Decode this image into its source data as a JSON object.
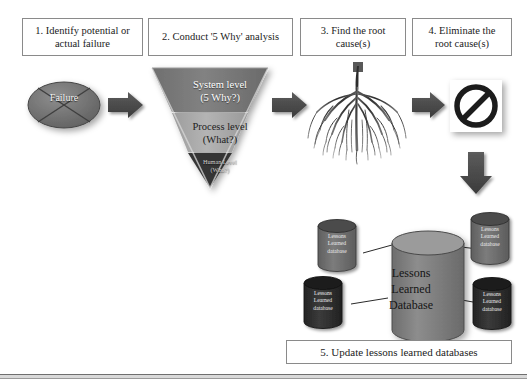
{
  "diagram": {
    "steps": [
      {
        "id": "step-1",
        "line1": "1. Identify potential or",
        "line2": "actual failure"
      },
      {
        "id": "step-2",
        "line1": "2. Conduct '5 Why' analysis",
        "line2": ""
      },
      {
        "id": "step-3",
        "line1": "3. Find the root",
        "line2": "cause(s)"
      },
      {
        "id": "step-4",
        "line1": "4. Eliminate the",
        "line2": "root cause(s)"
      }
    ],
    "caption": "5. Update lessons learned databases",
    "failure": {
      "label": "Failure"
    },
    "funnel": {
      "levels": [
        {
          "id": "system-level",
          "line1": "System level",
          "line2": "(5 Why?)"
        },
        {
          "id": "process-level",
          "line1": "Process level",
          "line2": "(What?)"
        },
        {
          "id": "human-level",
          "line1": "Human Level",
          "line2": "(Who?)"
        }
      ]
    },
    "root_cause_image": "tree-roots-illustration",
    "eliminate_sign": "prohibition-sign",
    "databases": {
      "main": {
        "line1": "Lessons",
        "line2": "Learned",
        "line3": "Database"
      },
      "satellites": [
        {
          "id": "db-top-left",
          "line1": "Lessons",
          "line2": "Learned",
          "line3": "database"
        },
        {
          "id": "db-top-right",
          "line1": "Lessons",
          "line2": "Learned",
          "line3": "database"
        },
        {
          "id": "db-bottom-left",
          "line1": "Lessons",
          "line2": "Learned",
          "line3": "database"
        },
        {
          "id": "db-bottom-right",
          "line1": "Lessons",
          "line2": "Learned",
          "line3": "database"
        }
      ]
    },
    "colors": {
      "box_border": "#8a8a8a",
      "arrow_fill": "#4a4a4a",
      "funnel_top": "#7d7d7d",
      "funnel_mid": "#a9a9a9",
      "funnel_bottom": "#3a3a3a",
      "cylinder_fill": "#7e7e7e",
      "cylinder_dark": "#2e2e2e",
      "page_background": "#ffffff"
    }
  }
}
